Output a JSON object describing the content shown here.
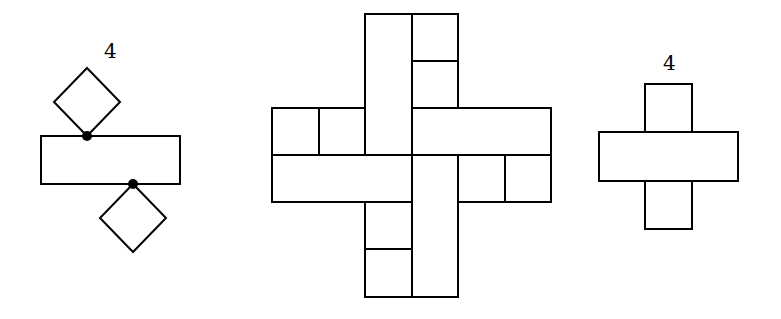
{
  "figures": [
    {
      "id": "left",
      "label": "4",
      "description": "A 3x1 rectangle with two unit squares rotated 45 degrees, attached at single corner points (marked by dots) on top and bottom edges"
    },
    {
      "id": "middle",
      "description": "Pinwheel-shaped tiling composed of 2x1 dominoes and unit squares on a 6x6 grid"
    },
    {
      "id": "right",
      "label": "4",
      "description": "Cross shape: a 3x1 rectangle with a unit square attached above and below its middle cell"
    }
  ]
}
